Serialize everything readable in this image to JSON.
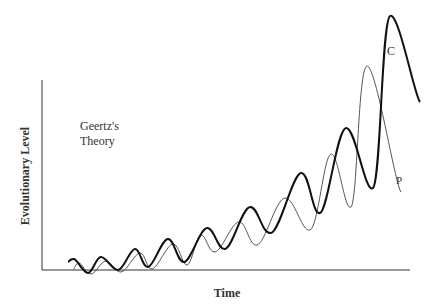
{
  "chart_data": {
    "type": "line",
    "title": "Geertz's Theory",
    "xlabel": "Time",
    "ylabel": "Evolutionary Level",
    "annotation": "Geertz's\nTheory",
    "grid": false,
    "legend": "inline labels at curve ends",
    "x_ticks": [],
    "y_ticks": [],
    "series": [
      {
        "name": "C",
        "style": "thick",
        "color": "#111111",
        "points_px": [
          [
            68,
            262
          ],
          [
            74,
            259
          ],
          [
            88,
            273
          ],
          [
            101,
            257
          ],
          [
            118,
            270
          ],
          [
            135,
            249
          ],
          [
            148,
            267
          ],
          [
            168,
            239
          ],
          [
            184,
            262
          ],
          [
            207,
            228
          ],
          [
            225,
            249
          ],
          [
            250,
            207
          ],
          [
            271,
            233
          ],
          [
            301,
            173
          ],
          [
            320,
            213
          ],
          [
            346,
            128
          ],
          [
            373,
            188
          ],
          [
            390,
            16
          ],
          [
            420,
            102
          ]
        ]
      },
      {
        "name": "P",
        "style": "thin",
        "color": "#444444",
        "points_px": [
          [
            73,
            270
          ],
          [
            79,
            263
          ],
          [
            91,
            274
          ],
          [
            106,
            261
          ],
          [
            121,
            272
          ],
          [
            140,
            253
          ],
          [
            152,
            269
          ],
          [
            173,
            244
          ],
          [
            187,
            265
          ],
          [
            201,
            235
          ],
          [
            215,
            252
          ],
          [
            239,
            222
          ],
          [
            257,
            245
          ],
          [
            285,
            198
          ],
          [
            310,
            230
          ],
          [
            331,
            154
          ],
          [
            351,
            207
          ],
          [
            367,
            66
          ],
          [
            401,
            192
          ]
        ]
      }
    ]
  },
  "labels": {
    "annotation_line1": "Geertz's",
    "annotation_line2": "Theory",
    "xlabel": "Time",
    "ylabel": "Evolutionary Level",
    "series_c": "C",
    "series_p": "P"
  }
}
